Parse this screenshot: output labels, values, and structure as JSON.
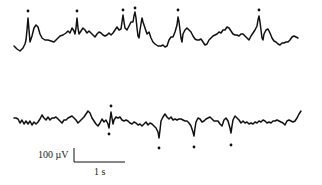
{
  "chart_data": {
    "type": "line",
    "title": "",
    "xlabel": "",
    "ylabel": "",
    "grid": false,
    "legend": null,
    "series": [
      {
        "name": "trace-top",
        "description": "Upper EEG trace with positive spikes marked by dots above",
        "points": [
          [
            14,
            46
          ],
          [
            17,
            49
          ],
          [
            20,
            51
          ],
          [
            23,
            48
          ],
          [
            25,
            44
          ],
          [
            26,
            40
          ],
          [
            27,
            30
          ],
          [
            28,
            18
          ],
          [
            29,
            30
          ],
          [
            30,
            42
          ],
          [
            32,
            36
          ],
          [
            34,
            28
          ],
          [
            36,
            25
          ],
          [
            38,
            27
          ],
          [
            40,
            34
          ],
          [
            42,
            38
          ],
          [
            45,
            40
          ],
          [
            48,
            40
          ],
          [
            51,
            41
          ],
          [
            54,
            42
          ],
          [
            57,
            39
          ],
          [
            60,
            36
          ],
          [
            63,
            35
          ],
          [
            66,
            33
          ],
          [
            68,
            31
          ],
          [
            70,
            33
          ],
          [
            72,
            28
          ],
          [
            74,
            31
          ],
          [
            75,
            34
          ],
          [
            76,
            28
          ],
          [
            77,
            18
          ],
          [
            78,
            28
          ],
          [
            79,
            34
          ],
          [
            81,
            31
          ],
          [
            83,
            28
          ],
          [
            85,
            30
          ],
          [
            87,
            33
          ],
          [
            89,
            31
          ],
          [
            91,
            33
          ],
          [
            93,
            35
          ],
          [
            95,
            37
          ],
          [
            97,
            34
          ],
          [
            99,
            32
          ],
          [
            101,
            33
          ],
          [
            103,
            35
          ],
          [
            105,
            36
          ],
          [
            107,
            35
          ],
          [
            109,
            33
          ],
          [
            111,
            35
          ],
          [
            113,
            33
          ],
          [
            115,
            30
          ],
          [
            117,
            27
          ],
          [
            119,
            30
          ],
          [
            121,
            29
          ],
          [
            122,
            22
          ],
          [
            123,
            15
          ],
          [
            124,
            22
          ],
          [
            125,
            28
          ],
          [
            127,
            30
          ],
          [
            129,
            26
          ],
          [
            131,
            22
          ],
          [
            133,
            22
          ],
          [
            134,
            16
          ],
          [
            135,
            12
          ],
          [
            136,
            18
          ],
          [
            137,
            28
          ],
          [
            138,
            36
          ],
          [
            139,
            38
          ],
          [
            140,
            30
          ],
          [
            141,
            24
          ],
          [
            142,
            18
          ],
          [
            143,
            22
          ],
          [
            145,
            28
          ],
          [
            147,
            34
          ],
          [
            149,
            32
          ],
          [
            151,
            38
          ],
          [
            153,
            42
          ],
          [
            155,
            44
          ],
          [
            158,
            46
          ],
          [
            161,
            46
          ],
          [
            163,
            45
          ],
          [
            165,
            47
          ],
          [
            167,
            46
          ],
          [
            169,
            40
          ],
          [
            171,
            37
          ],
          [
            173,
            37
          ],
          [
            175,
            32
          ],
          [
            177,
            25
          ],
          [
            178,
            17
          ],
          [
            179,
            22
          ],
          [
            180,
            30
          ],
          [
            181,
            38
          ],
          [
            182,
            42
          ],
          [
            183,
            34
          ],
          [
            185,
            30
          ],
          [
            187,
            28
          ],
          [
            189,
            30
          ],
          [
            191,
            32
          ],
          [
            193,
            36
          ],
          [
            195,
            39
          ],
          [
            197,
            40
          ],
          [
            199,
            40
          ],
          [
            201,
            39
          ],
          [
            203,
            42
          ],
          [
            205,
            45
          ],
          [
            207,
            44
          ],
          [
            209,
            40
          ],
          [
            211,
            38
          ],
          [
            213,
            36
          ],
          [
            215,
            35
          ],
          [
            217,
            34
          ],
          [
            219,
            32
          ],
          [
            221,
            33
          ],
          [
            223,
            30
          ],
          [
            225,
            30
          ],
          [
            227,
            27
          ],
          [
            229,
            28
          ],
          [
            231,
            31
          ],
          [
            233,
            34
          ],
          [
            235,
            35
          ],
          [
            237,
            35
          ],
          [
            239,
            36
          ],
          [
            241,
            34
          ],
          [
            243,
            34
          ],
          [
            245,
            36
          ],
          [
            247,
            38
          ],
          [
            249,
            40
          ],
          [
            251,
            36
          ],
          [
            253,
            33
          ],
          [
            255,
            30
          ],
          [
            257,
            26
          ],
          [
            258,
            20
          ],
          [
            259,
            16
          ],
          [
            260,
            22
          ],
          [
            261,
            30
          ],
          [
            262,
            38
          ],
          [
            263,
            40
          ],
          [
            264,
            34
          ],
          [
            266,
            30
          ],
          [
            268,
            29
          ],
          [
            270,
            33
          ],
          [
            272,
            38
          ],
          [
            274,
            41
          ],
          [
            276,
            42
          ],
          [
            278,
            44
          ],
          [
            280,
            45
          ],
          [
            282,
            43
          ],
          [
            284,
            43
          ],
          [
            286,
            42
          ],
          [
            288,
            42
          ],
          [
            290,
            40
          ],
          [
            292,
            37
          ],
          [
            294,
            36
          ],
          [
            296,
            37
          ],
          [
            298,
            38
          ]
        ]
      },
      {
        "name": "trace-bottom",
        "description": "Lower EEG trace with negative spikes marked by dots below",
        "points": [
          [
            14,
            118
          ],
          [
            16,
            118
          ],
          [
            18,
            119
          ],
          [
            20,
            123
          ],
          [
            22,
            120
          ],
          [
            24,
            124
          ],
          [
            26,
            121
          ],
          [
            28,
            124
          ],
          [
            30,
            121
          ],
          [
            32,
            125
          ],
          [
            34,
            122
          ],
          [
            36,
            124
          ],
          [
            38,
            122
          ],
          [
            40,
            119
          ],
          [
            42,
            115
          ],
          [
            44,
            118
          ],
          [
            46,
            120
          ],
          [
            48,
            117
          ],
          [
            50,
            120
          ],
          [
            52,
            118
          ],
          [
            54,
            118
          ],
          [
            56,
            117
          ],
          [
            58,
            119
          ],
          [
            60,
            121
          ],
          [
            62,
            123
          ],
          [
            64,
            120
          ],
          [
            66,
            120
          ],
          [
            68,
            118
          ],
          [
            70,
            117
          ],
          [
            72,
            116
          ],
          [
            74,
            118
          ],
          [
            76,
            120
          ],
          [
            78,
            123
          ],
          [
            80,
            121
          ],
          [
            82,
            119
          ],
          [
            84,
            117
          ],
          [
            86,
            114
          ],
          [
            88,
            111
          ],
          [
            90,
            113
          ],
          [
            92,
            118
          ],
          [
            94,
            121
          ],
          [
            96,
            124
          ],
          [
            98,
            126
          ],
          [
            100,
            123
          ],
          [
            102,
            119
          ],
          [
            104,
            122
          ],
          [
            106,
            120
          ],
          [
            108,
            124
          ],
          [
            109,
            128
          ],
          [
            110,
            120
          ],
          [
            111,
            112
          ],
          [
            112,
            118
          ],
          [
            113,
            124
          ],
          [
            114,
            120
          ],
          [
            116,
            117
          ],
          [
            118,
            118
          ],
          [
            120,
            117
          ],
          [
            122,
            120
          ],
          [
            124,
            121
          ],
          [
            126,
            120
          ],
          [
            128,
            121
          ],
          [
            130,
            123
          ],
          [
            132,
            124
          ],
          [
            134,
            122
          ],
          [
            136,
            123
          ],
          [
            138,
            125
          ],
          [
            140,
            124
          ],
          [
            142,
            126
          ],
          [
            144,
            124
          ],
          [
            146,
            122
          ],
          [
            148,
            125
          ],
          [
            150,
            123
          ],
          [
            152,
            124
          ],
          [
            154,
            126
          ],
          [
            156,
            128
          ],
          [
            158,
            132
          ],
          [
            159,
            138
          ],
          [
            160,
            130
          ],
          [
            161,
            121
          ],
          [
            163,
            117
          ],
          [
            165,
            114
          ],
          [
            167,
            117
          ],
          [
            169,
            119
          ],
          [
            171,
            117
          ],
          [
            173,
            120
          ],
          [
            175,
            119
          ],
          [
            177,
            120
          ],
          [
            179,
            119
          ],
          [
            181,
            119
          ],
          [
            183,
            120
          ],
          [
            185,
            121
          ],
          [
            187,
            121
          ],
          [
            189,
            123
          ],
          [
            191,
            126
          ],
          [
            193,
            132
          ],
          [
            194,
            136
          ],
          [
            195,
            128
          ],
          [
            196,
            122
          ],
          [
            198,
            118
          ],
          [
            200,
            119
          ],
          [
            202,
            122
          ],
          [
            204,
            121
          ],
          [
            206,
            119
          ],
          [
            208,
            118
          ],
          [
            210,
            117
          ],
          [
            212,
            119
          ],
          [
            214,
            121
          ],
          [
            216,
            121
          ],
          [
            218,
            121
          ],
          [
            220,
            124
          ],
          [
            222,
            126
          ],
          [
            224,
            120
          ],
          [
            226,
            118
          ],
          [
            228,
            121
          ],
          [
            230,
            128
          ],
          [
            231,
            133
          ],
          [
            232,
            126
          ],
          [
            233,
            120
          ],
          [
            235,
            116
          ],
          [
            237,
            118
          ],
          [
            239,
            120
          ],
          [
            241,
            123
          ],
          [
            243,
            121
          ],
          [
            245,
            123
          ],
          [
            247,
            122
          ],
          [
            249,
            124
          ],
          [
            251,
            123
          ],
          [
            253,
            124
          ],
          [
            255,
            122
          ],
          [
            257,
            123
          ],
          [
            259,
            121
          ],
          [
            261,
            122
          ],
          [
            263,
            120
          ],
          [
            265,
            121
          ],
          [
            267,
            123
          ],
          [
            269,
            122
          ],
          [
            271,
            123
          ],
          [
            273,
            121
          ],
          [
            275,
            121
          ],
          [
            277,
            120
          ],
          [
            279,
            121
          ],
          [
            281,
            122
          ],
          [
            283,
            123
          ],
          [
            285,
            125
          ],
          [
            287,
            121
          ],
          [
            289,
            120
          ],
          [
            291,
            121
          ],
          [
            293,
            122
          ],
          [
            295,
            121
          ],
          [
            297,
            118
          ],
          [
            299,
            114
          ],
          [
            301,
            111
          ]
        ]
      }
    ],
    "spike_markers": {
      "top": [
        [
          28,
          11
        ],
        [
          77,
          11
        ],
        [
          123,
          10
        ],
        [
          135,
          8
        ],
        [
          178,
          10
        ],
        [
          259,
          10
        ]
      ],
      "bottom": [
        [
          111,
          106
        ],
        [
          109,
          134
        ],
        [
          159,
          148
        ],
        [
          194,
          147
        ],
        [
          231,
          145
        ]
      ]
    },
    "scale_bar": {
      "amplitude_label": "100 µV",
      "time_label": "1 s",
      "vertical": {
        "x": 74,
        "y1": 148,
        "y2": 162
      },
      "horizontal": {
        "x1": 74,
        "x2": 125,
        "y": 162
      }
    },
    "xlim": [
      0,
      322
    ],
    "ylim": [
      0,
      185
    ]
  },
  "colors": {
    "trace": "#111111",
    "background": "#ffffff",
    "text": "#222222"
  }
}
